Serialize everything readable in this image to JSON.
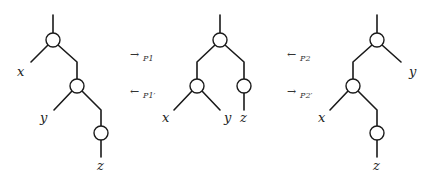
{
  "diagram": {
    "trees": [
      {
        "id": "left",
        "structure": "(x, (y, (z)))",
        "leaves": {
          "x": "x",
          "y": "y",
          "z": "z"
        }
      },
      {
        "id": "middle",
        "structure": "((x, y), (z))",
        "leaves": {
          "x": "x",
          "y": "y",
          "z": "z"
        }
      },
      {
        "id": "right",
        "structure": "((x, (z)), y)",
        "leaves": {
          "x": "x",
          "y": "y",
          "z": "z"
        }
      }
    ],
    "arrows": {
      "p1": {
        "glyph": "→",
        "label": "P1"
      },
      "p1p": {
        "glyph": "←",
        "label": "P1′"
      },
      "p2": {
        "glyph": "←",
        "label": "P2"
      },
      "p2p": {
        "glyph": "→",
        "label": "P2′"
      }
    }
  }
}
